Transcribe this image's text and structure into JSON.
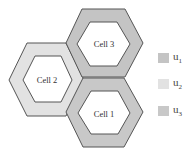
{
  "diagram": {
    "cells": [
      {
        "id": "cell3",
        "label": "Cell 3",
        "ring_color": "#c4c4c4",
        "outer": "82,9 125,9 143,43 125,77 82,77 66,43",
        "inner": "90,22 117,22 130,44 117,66 90,66 77,44",
        "label_x": 104,
        "label_y": 47
      },
      {
        "id": "cell2",
        "label": "Cell  2",
        "ring_color": "#e2e2e2",
        "outer": "27,43 66,43 84,80 66,116 27,116 9,80",
        "inner": "35,56 61,56 72,80 61,102 35,102 23,80",
        "label_x": 47,
        "label_y": 83
      },
      {
        "id": "cell1",
        "label": "Cell 1",
        "ring_color": "#c8c8c8",
        "outer": "83,78 124,78 143,112 124,147 83,147 66,112",
        "inner": "91,91 118,91 130,113 118,134 91,134 78,113",
        "label_x": 104,
        "label_y": 117
      }
    ],
    "legend": [
      {
        "label": "u",
        "sub": "1",
        "color": "#c4c4c4"
      },
      {
        "label": "u",
        "sub": "2",
        "color": "#e2e2e2"
      },
      {
        "label": "u",
        "sub": "3",
        "color": "#c8c8c8"
      }
    ]
  }
}
